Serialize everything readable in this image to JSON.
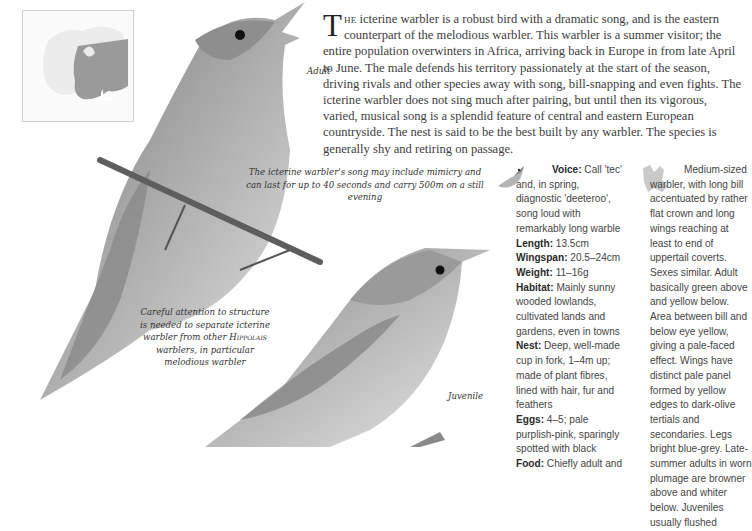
{
  "map": {
    "icon": "europe-range-map-icon",
    "colors": {
      "range": "#9a9a9a",
      "land": "#ececec",
      "wintering_marker": "#ffffff"
    }
  },
  "illustration": {
    "labels": {
      "adult": "Adult",
      "juvenile": "Juvenile"
    },
    "colors": {
      "plumage_dark": "#6e6e6e",
      "plumage_mid": "#9d9d9d",
      "plumage_light": "#d8d8d8",
      "branch": "#5e5e5e"
    }
  },
  "intro": {
    "dropcap": "T",
    "lead": "he",
    "text": " icterine warbler is a robust bird with a dramatic song, and is the eastern counterpart of the melodious warbler. This warbler is a summer visitor; the entire population overwinters in Africa, arriving back in Europe in from late April to June. The male defends his territory passionately at the start of the season, driving rivals and other species away with song, bill-snapping and even fights. The icterine warbler does not sing much after pairing, but until then its vigorous, varied, musical song is a splendid feature of central and eastern European countryside. The nest is said to be the best built by any warbler. The species is generally shy and retiring on passage."
  },
  "captions": {
    "song": "The icterine warbler's song may include mimicry and can last for up to 40 seconds and carry 500m on a still evening",
    "careful_pre": "Careful attention to structure is needed to separate icterine warbler from other ",
    "careful_genus": "Hippolais",
    "careful_post": " warblers, in particular melodious warbler"
  },
  "facts": {
    "voice_icon": "singing-bird-icon",
    "items": [
      {
        "label": "Voice:",
        "value": " Call 'tec' and, in spring, diagnostic 'deeteroo', song loud with remarkably long warble"
      },
      {
        "label": "Length:",
        "value": " 13.5cm"
      },
      {
        "label": "Wingspan:",
        "value": " 20.5–24cm"
      },
      {
        "label": "Weight:",
        "value": " 11–16g"
      },
      {
        "label": "Habitat:",
        "value": " Mainly sunny wooded lowlands, cultivated lands and gardens, even in towns"
      },
      {
        "label": "Nest:",
        "value": " Deep, well-made cup in fork, 1–4m up; made of plant fibres, lined with hair, fur and feathers"
      },
      {
        "label": "Eggs:",
        "value": " 4–5; pale purplish-pink, sparingly spotted with black"
      },
      {
        "label": "Food:",
        "value": " Chiefly adult and"
      }
    ]
  },
  "description": {
    "size_icon": "bird-silhouette-size-icon",
    "text": "Medium-sized warbler, with long bill accentuated by rather flat crown and long wings reaching at least to end of uppertail coverts. Sexes similar. Adult basically green above and yellow below. Area between bill and below eye yellow, giving a pale-faced effect. Wings have distinct pale panel formed by yellow edges to dark-olive tertials and secondaries. Legs bright blue-grey. Late-summer adults in worn plumage are browner above and whiter below. Juveniles usually flushed"
  }
}
